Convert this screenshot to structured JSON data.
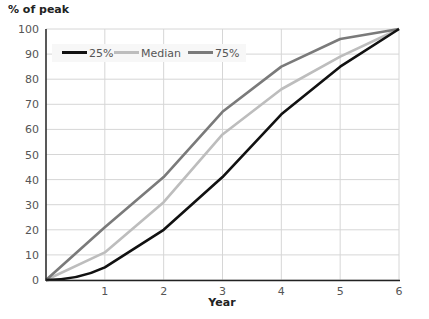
{
  "chart_data": {
    "type": "line",
    "title": "",
    "ylabel": "% of peak",
    "xlabel": "Year",
    "x": [
      0,
      1,
      2,
      3,
      4,
      5,
      6
    ],
    "xticks": [
      "1",
      "2",
      "3",
      "4",
      "5",
      "6"
    ],
    "yticks": [
      "0",
      "10",
      "20",
      "30",
      "40",
      "50",
      "60",
      "70",
      "80",
      "90",
      "100"
    ],
    "xlim": [
      0,
      6
    ],
    "ylim": [
      0,
      100
    ],
    "grid": true,
    "legend_position": "top-left inside",
    "series": [
      {
        "name": "25%",
        "color": "#111111",
        "values": [
          0,
          5,
          20,
          41,
          66,
          85,
          100
        ]
      },
      {
        "name": "Median",
        "color": "#bdbdbd",
        "values": [
          0,
          11,
          31,
          58,
          76,
          89,
          100
        ]
      },
      {
        "name": "75%",
        "color": "#7a7a7a",
        "values": [
          0,
          21,
          41,
          67,
          85,
          96,
          100
        ]
      }
    ]
  }
}
